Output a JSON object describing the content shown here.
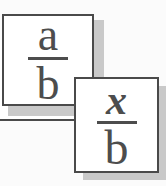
{
  "cards": {
    "back": {
      "numerator": "a",
      "denominator": "b"
    },
    "front": {
      "numerator": "x",
      "denominator": "b"
    }
  },
  "colors": {
    "page_background": "#fbfbfb",
    "card_background": "#ffffff",
    "border": "#4a4a4a",
    "glyph": "#4d4d4d",
    "shadow": "#c9c9c9"
  }
}
